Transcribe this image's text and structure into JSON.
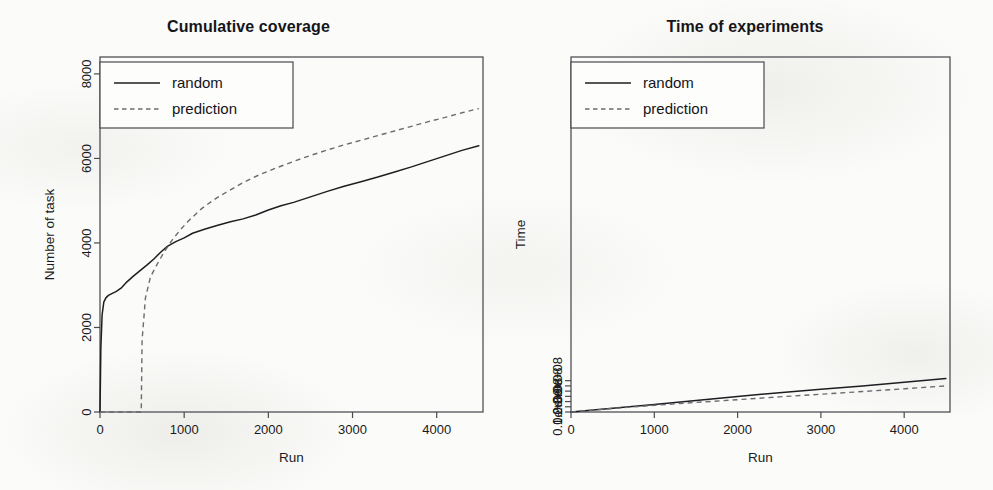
{
  "figure": {
    "background_color": "#fbfbf9",
    "ink_color": "#1e1e22",
    "dashed_color": "#6b6b70",
    "panel_count": 2
  },
  "chart_data": [
    {
      "type": "line",
      "panel": "left",
      "title": "Cumulative coverage",
      "xlabel": "Run",
      "ylabel": "Number of task",
      "xlim": [
        0,
        4550
      ],
      "ylim": [
        0,
        8400
      ],
      "xticks": [
        0,
        1000,
        2000,
        3000,
        4000
      ],
      "xticklabels": [
        "0",
        "1000",
        "2000",
        "3000",
        "4000"
      ],
      "yticks": [
        0,
        2000,
        4000,
        6000,
        8000
      ],
      "yticklabels": [
        "0",
        "2000",
        "4000",
        "6000",
        "8000"
      ],
      "grid": false,
      "legend_position": "top-left",
      "series": [
        {
          "name": "random",
          "style": "solid",
          "color": "#1e1e22",
          "x": [
            0,
            10,
            25,
            45,
            70,
            100,
            140,
            190,
            250,
            320,
            400,
            480,
            560,
            640,
            720,
            800,
            900,
            1000,
            1100,
            1250,
            1400,
            1550,
            1700,
            1850,
            2000,
            2150,
            2300,
            2500,
            2700,
            2900,
            3100,
            3300,
            3500,
            3700,
            3900,
            4100,
            4300,
            4500
          ],
          "y": [
            0,
            1500,
            2300,
            2600,
            2700,
            2760,
            2800,
            2850,
            2930,
            3080,
            3220,
            3350,
            3480,
            3620,
            3780,
            3920,
            4030,
            4120,
            4230,
            4330,
            4420,
            4500,
            4570,
            4660,
            4780,
            4880,
            4960,
            5090,
            5220,
            5340,
            5450,
            5560,
            5680,
            5800,
            5930,
            6060,
            6190,
            6300
          ]
        },
        {
          "name": "prediction",
          "style": "dashed",
          "color": "#6b6b70",
          "x": [
            0,
            200,
            400,
            490,
            500,
            540,
            600,
            680,
            760,
            850,
            950,
            1050,
            1200,
            1350,
            1500,
            1700,
            1900,
            2100,
            2300,
            2500,
            2700,
            2900,
            3100,
            3300,
            3500,
            3700,
            3900,
            4100,
            4300,
            4500
          ],
          "y": [
            0,
            0,
            0,
            0,
            1700,
            2700,
            3200,
            3500,
            3780,
            4050,
            4300,
            4520,
            4800,
            5020,
            5200,
            5430,
            5620,
            5780,
            5930,
            6070,
            6200,
            6320,
            6430,
            6540,
            6650,
            6760,
            6870,
            6970,
            7080,
            7180
          ]
        }
      ]
    },
    {
      "type": "line",
      "panel": "right",
      "title": "Time of experiments",
      "xlabel": "Run",
      "ylabel": "Time",
      "xlim": [
        0,
        4550
      ],
      "ylim": [
        0,
        3400000000
      ],
      "xticks": [
        0,
        1000,
        2000,
        3000,
        4000
      ],
      "xticklabels": [
        "0",
        "1000",
        "2000",
        "3000",
        "4000"
      ],
      "yticks": [
        0,
        100000000,
        200000000,
        300000000
      ],
      "yticklabels": [
        "0.0e+00",
        "1.0e+08",
        "2.0e+08",
        "3.0e+08"
      ],
      "yminorticks": [
        50000000,
        150000000,
        250000000
      ],
      "grid": false,
      "legend_position": "top-left",
      "series": [
        {
          "name": "random",
          "style": "solid",
          "color": "#1e1e22",
          "x": [
            0,
            500,
            1000,
            1500,
            2000,
            2500,
            3000,
            3500,
            4000,
            4500
          ],
          "y": [
            0,
            36000000,
            72000000,
            110000000,
            148000000,
            185000000,
            218000000,
            250000000,
            285000000,
            320000000
          ]
        },
        {
          "name": "prediction",
          "style": "dashed",
          "color": "#6b6b70",
          "x": [
            0,
            500,
            1000,
            1500,
            2000,
            2500,
            3000,
            3500,
            4000,
            4500
          ],
          "y": [
            0,
            34000000,
            64000000,
            92000000,
            118000000,
            145000000,
            170000000,
            196000000,
            222000000,
            250000000
          ]
        }
      ]
    }
  ],
  "legend": {
    "entries": [
      {
        "label": "random",
        "style": "solid"
      },
      {
        "label": "prediction",
        "style": "dashed"
      }
    ]
  }
}
